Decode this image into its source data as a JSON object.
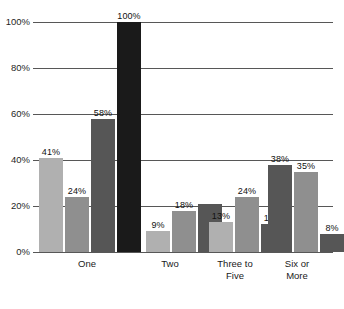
{
  "chart_data": {
    "type": "bar",
    "title": "",
    "subtitle": "",
    "xlabel": "",
    "ylabel": "",
    "ylim": [
      0,
      100
    ],
    "yticks": [
      0,
      20,
      40,
      60,
      80,
      100
    ],
    "ytick_labels": [
      "0%",
      "20%",
      "40%",
      "60%",
      "80%",
      "100%"
    ],
    "grid": true,
    "legend": "none",
    "categories": [
      "One",
      "Two",
      "Three to\nFive",
      "Six or\nMore"
    ],
    "groups": [
      {
        "category": "One",
        "bars": [
          {
            "value": 41,
            "label": "41%",
            "color": "#b0b0b0"
          },
          {
            "value": 24,
            "label": "24%",
            "color": "#8f8f8f"
          },
          {
            "value": 58,
            "label": "58%",
            "color": "#565656"
          },
          {
            "value": 100,
            "label": "100%",
            "color": "#1a1a1a"
          }
        ]
      },
      {
        "category": "Two",
        "bars": [
          {
            "value": 9,
            "label": "9%",
            "color": "#b0b0b0"
          },
          {
            "value": 18,
            "label": "18%",
            "color": "#8f8f8f"
          },
          {
            "value": 21,
            "label": "",
            "color": "#565656"
          }
        ]
      },
      {
        "category": "Three to\nFive",
        "bars": [
          {
            "value": 13,
            "label": "13%",
            "color": "#b0b0b0"
          },
          {
            "value": 24,
            "label": "24%",
            "color": "#8f8f8f"
          },
          {
            "value": 12,
            "label": "12%",
            "color": "#565656"
          }
        ]
      },
      {
        "category": "Six or\nMore",
        "bars": [
          {
            "value": 38,
            "label": "38%",
            "color": "#565656"
          },
          {
            "value": 35,
            "label": "35%",
            "color": "#8f8f8f"
          },
          {
            "value": 8,
            "label": "8%",
            "color": "#565656"
          }
        ]
      }
    ],
    "colors": {
      "light_gray": "#b0b0b0",
      "medium_gray": "#8f8f8f",
      "dark_gray": "#565656",
      "black": "#1a1a1a",
      "gridline": "#575757",
      "background": "#ffffff"
    }
  }
}
